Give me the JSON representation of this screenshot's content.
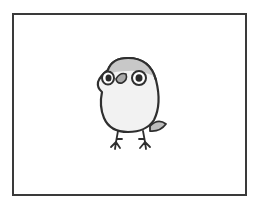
{
  "image": {
    "subject": "cartoon bird illustration",
    "description": "Round white-bellied bird with gray cap, large round eyes, small gray beak, gray tail, two thin legs, inside a rectangular frame"
  },
  "frame": {
    "border_color": "#3a3a3a",
    "background": "#ffffff"
  },
  "bird": {
    "outline_color": "#2f2f2f",
    "cap_color": "#c8c8c8",
    "belly_color": "#f2f2f2",
    "beak_color": "#a9a9a9",
    "tail_color": "#bdbdbd",
    "eye_color": "#2a2a2a"
  }
}
